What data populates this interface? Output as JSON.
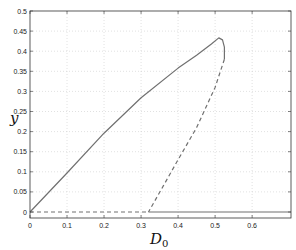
{
  "chart_data": {
    "type": "line",
    "title": "",
    "xlabel": "D_0",
    "xlabel_main": "D",
    "xlabel_sub": "0",
    "ylabel": "y",
    "xlim": [
      0,
      0.705
    ],
    "ylim": [
      0,
      0.5
    ],
    "grid": true,
    "legend": null,
    "xticks": [
      "0",
      "0.1",
      "0.2",
      "0.3",
      "0.4",
      "0.5",
      "0.6"
    ],
    "yticks": [
      "0",
      "0.05",
      "0.1",
      "0.15",
      "0.2",
      "0.25",
      "0.3",
      "0.35",
      "0.4",
      "0.45",
      "0.5"
    ],
    "series": [
      {
        "name": "stable upper branch",
        "style": "solid",
        "x": [
          0,
          0.1,
          0.2,
          0.3,
          0.4,
          0.45,
          0.49,
          0.51,
          0.52,
          0.525,
          0.525
        ],
        "y": [
          0,
          0.097,
          0.196,
          0.284,
          0.358,
          0.39,
          0.418,
          0.433,
          0.428,
          0.41,
          0.38
        ]
      },
      {
        "name": "unstable branch",
        "style": "dashed",
        "x": [
          0.525,
          0.5,
          0.45,
          0.4,
          0.36,
          0.32
        ],
        "y": [
          0.38,
          0.31,
          0.21,
          0.13,
          0.065,
          0
        ]
      },
      {
        "name": "trivial unstable",
        "style": "dashed",
        "x": [
          0,
          0.32
        ],
        "y": [
          0,
          0
        ]
      },
      {
        "name": "trivial stable",
        "style": "solid",
        "x": [
          0.32,
          0.705
        ],
        "y": [
          0,
          0
        ]
      }
    ]
  },
  "colors": {
    "line": "#707070",
    "axis": "#333333",
    "grid": "#cccccc"
  }
}
